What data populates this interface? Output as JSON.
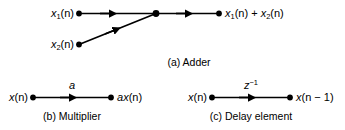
{
  "figure": {
    "background_color": "#ffffff",
    "stroke_color": "#000000",
    "panels": [
      {
        "id": "adder",
        "caption": "(a) Adder",
        "inputs": [
          "x1(n)",
          "x2(n)"
        ],
        "output": "x1(n) + x2(n)",
        "operation": "sum"
      },
      {
        "id": "multiplier",
        "caption": "(b) Multiplier",
        "inputs": [
          "x(n)"
        ],
        "output": "ax(n)",
        "branch_gain": "a",
        "operation": "scalar-multiply"
      },
      {
        "id": "delay",
        "caption": "(c) Delay element",
        "inputs": [
          "x(n)"
        ],
        "output": "x(n - 1)",
        "branch_gain": "z^-1",
        "operation": "unit-delay"
      }
    ]
  },
  "adder": {
    "input1_label_x": "x",
    "input1_label_sub": "1",
    "input1_label_tail": "(n)",
    "input2_label_x": "x",
    "input2_label_sub": "2",
    "input2_label_tail": "(n)",
    "output_x1": "x",
    "output_sub1": "1",
    "output_mid": "(n) + ",
    "output_x2": "x",
    "output_sub2": "2",
    "output_tail": "(n)",
    "caption": "(a) Adder"
  },
  "multiplier": {
    "input_label_x": "x",
    "input_label_tail": "(n)",
    "gain_label": "a",
    "output_label_a": "a",
    "output_label_x": "x",
    "output_label_tail": "(n)",
    "caption": "(b) Multiplier"
  },
  "delay": {
    "input_label_x": "x",
    "input_label_tail": "(n)",
    "gain_label_z": "z",
    "gain_label_exp": "−1",
    "output_label_x": "x",
    "output_label_tail": "(n − 1)",
    "caption": "(c) Delay element"
  }
}
